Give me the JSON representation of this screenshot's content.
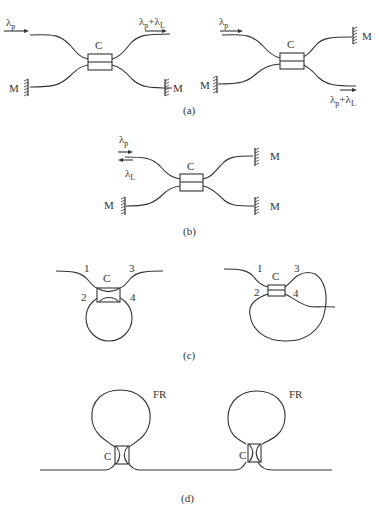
{
  "figure": {
    "panels": [
      {
        "id": "a",
        "caption": "(a)",
        "left": {
          "input_label": "λ",
          "input_sub": "p",
          "output_label": "λ",
          "output_sub_p": "p",
          "output_plus": "+λ",
          "output_sub_l": "L",
          "coupler_label": "C",
          "mirror_labels": [
            "M",
            "M"
          ]
        },
        "right": {
          "input_label": "λ",
          "input_sub": "p",
          "output_label": "λ",
          "output_sub_p": "p",
          "output_plus": "+λ",
          "output_sub_l": "L",
          "coupler_label": "C",
          "mirror_labels": [
            "M",
            "M"
          ]
        }
      },
      {
        "id": "b",
        "caption": "(b)",
        "input_label": "λ",
        "input_sub": "p",
        "return_label": "λ",
        "return_sub": "L",
        "coupler_label": "C",
        "mirror_labels": [
          "M",
          "M",
          "M"
        ]
      },
      {
        "id": "c",
        "caption": "(c)",
        "left": {
          "coupler_label": "C",
          "port_labels": [
            "1",
            "2",
            "3",
            "4"
          ]
        },
        "right": {
          "coupler_label": "C",
          "port_labels": [
            "1",
            "2",
            "3",
            "4"
          ]
        }
      },
      {
        "id": "d",
        "caption": "(d)",
        "rings": [
          {
            "ring_label": "FR",
            "coupler_label": "C"
          },
          {
            "ring_label": "FR",
            "coupler_label": "C"
          }
        ]
      }
    ]
  }
}
